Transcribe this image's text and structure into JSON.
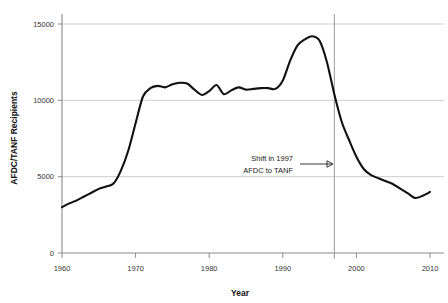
{
  "chart_data": {
    "type": "line",
    "title": "",
    "xlabel": "Year",
    "ylabel": "AFDC/TANF Recipients",
    "xlim": [
      1960,
      2010
    ],
    "ylim": [
      0,
      15500
    ],
    "grid": true,
    "legend": "none",
    "x_ticks": [
      "1960",
      "1970",
      "1980",
      "1990",
      "2000",
      "2010"
    ],
    "x_tick_values": [
      1960,
      1970,
      1980,
      1990,
      2000,
      2010
    ],
    "y_ticks": [
      "0",
      "5000",
      "10000",
      "15000"
    ],
    "y_tick_values": [
      0,
      5000,
      10000,
      15000
    ],
    "series": [
      {
        "name": "AFDC/TANF Recipients",
        "color": "#111111",
        "x": [
          1960,
          1961,
          1962,
          1963,
          1964,
          1965,
          1966,
          1967,
          1968,
          1969,
          1970,
          1971,
          1972,
          1973,
          1974,
          1975,
          1976,
          1977,
          1978,
          1979,
          1980,
          1981,
          1982,
          1983,
          1984,
          1985,
          1986,
          1987,
          1988,
          1989,
          1990,
          1991,
          1992,
          1993,
          1994,
          1995,
          1996,
          1997,
          1998,
          1999,
          2000,
          2001,
          2002,
          2003,
          2004,
          2005,
          2006,
          2007,
          2008,
          2009,
          2010
        ],
        "values": [
          3000,
          3250,
          3450,
          3700,
          3950,
          4200,
          4350,
          4550,
          5400,
          6700,
          8500,
          10250,
          10800,
          10950,
          10850,
          11050,
          11150,
          11100,
          10700,
          10350,
          10600,
          11000,
          10400,
          10650,
          10850,
          10700,
          10750,
          10800,
          10800,
          10750,
          11300,
          12600,
          13600,
          14000,
          14200,
          13900,
          12500,
          10400,
          8600,
          7400,
          6300,
          5500,
          5100,
          4900,
          4700,
          4500,
          4200,
          3900,
          3600,
          3750,
          4000
        ]
      }
    ],
    "annotations": [
      {
        "id": "tanf-shift",
        "line1": "Shift in 1997",
        "line2": "AFDC to TANF",
        "event_year": 1997,
        "arrow": "right",
        "vertical_rule": true
      }
    ]
  }
}
